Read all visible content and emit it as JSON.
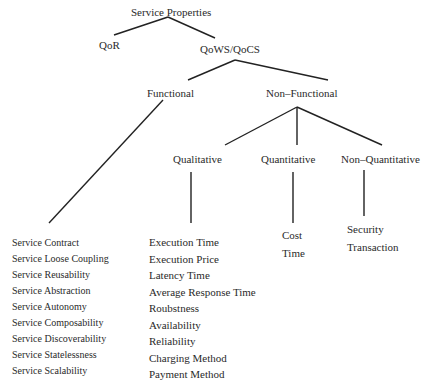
{
  "diagram": {
    "title": "Service Properties",
    "nodes": {
      "root": "Service Properties",
      "qor": "QoR",
      "qows": "QoWS/QoCS",
      "functional": "Functional",
      "non_functional": "Non–Functional",
      "qualitative": "Qualitative",
      "quantitative": "Quantitative",
      "non_quantitative": "Non–Quantitative"
    },
    "lists": {
      "functional": [
        "Service Contract",
        "Service Loose Coupling",
        "Service Reusability",
        "Service Abstraction",
        "Service Autonomy",
        "Service Composability",
        "Service Discoverability",
        "Service Statelessness",
        "Service Scalability"
      ],
      "qualitative": [
        "Execution Time",
        "Execution Price",
        "Latency Time",
        "Average Response Time",
        "Roubstness",
        "Availability",
        "Reliability",
        "Charging Method",
        "Payment Method"
      ],
      "quantitative": [
        "Cost",
        "Time"
      ],
      "non_quantitative": [
        "Security",
        "Transaction"
      ]
    },
    "line_color": "#222222"
  }
}
